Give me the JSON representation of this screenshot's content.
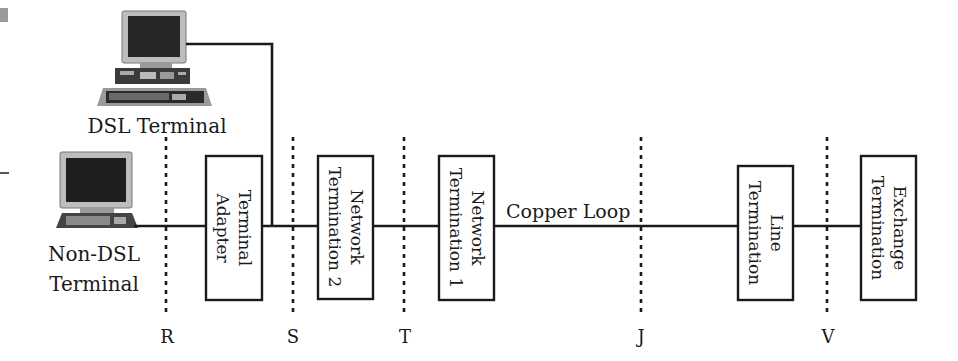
{
  "diagram": {
    "type": "DSL reference model",
    "terminals": {
      "dsl": {
        "label": "DSL Terminal"
      },
      "non_dsl": {
        "label_line1": "Non-DSL",
        "label_line2": "Terminal"
      }
    },
    "blocks": [
      {
        "id": "terminal-adapter",
        "line1": "Terminal",
        "line2": "Adapter"
      },
      {
        "id": "network-termination-2",
        "line1": "Network",
        "line2": "Termination 2"
      },
      {
        "id": "network-termination-1",
        "line1": "Network",
        "line2": "Termination 1"
      },
      {
        "id": "line-termination",
        "line1": "Line",
        "line2": "Termination"
      },
      {
        "id": "exchange-termination",
        "line1": "Exchange",
        "line2": "Termination"
      }
    ],
    "link_label": "Copper Loop",
    "reference_points": [
      "R",
      "S",
      "T",
      "J",
      "V"
    ],
    "colors": {
      "ink": "#1a1a1a",
      "screen": "#262626",
      "monitor_frame": "#b5b5b5",
      "accent_gray": "#8c8c8c"
    }
  }
}
